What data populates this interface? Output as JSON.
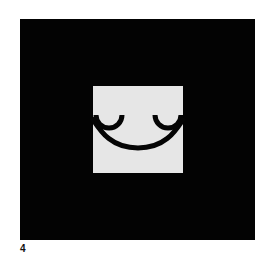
{
  "figure": {
    "label": "4",
    "colors": {
      "background": "#ffffff",
      "frame": "#030303",
      "panel": "#e6e6e6",
      "stroke": "#050505"
    },
    "icon": "smile-face-glyph"
  }
}
